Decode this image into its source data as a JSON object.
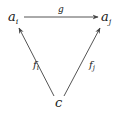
{
  "diagram": {
    "type": "commutative-diagram",
    "nodes": [
      {
        "id": "ai",
        "label": "a",
        "subscript": "i"
      },
      {
        "id": "aj",
        "label": "a",
        "subscript": "j"
      },
      {
        "id": "c",
        "label": "c"
      }
    ],
    "arrows": [
      {
        "from": "ai",
        "to": "aj",
        "label": "g",
        "subscript": ""
      },
      {
        "from": "c",
        "to": "ai",
        "label": "f",
        "subscript": "i"
      },
      {
        "from": "c",
        "to": "aj",
        "label": "f",
        "subscript": "j"
      }
    ],
    "colors": {
      "ink": "#1a1a1a",
      "arrow": "#555555"
    }
  }
}
